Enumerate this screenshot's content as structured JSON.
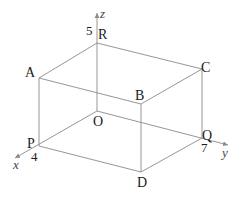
{
  "figure": {
    "type": "3d-cuboid-coordinate-diagram",
    "axes": {
      "x": {
        "label": "x",
        "tick_label": "4"
      },
      "y": {
        "label": "y",
        "tick_label": "7"
      },
      "z": {
        "label": "z",
        "tick_label": "5"
      }
    },
    "vertices": {
      "O": {
        "label": "O",
        "coords": [
          0,
          0,
          0
        ]
      },
      "P": {
        "label": "P",
        "coords": [
          4,
          0,
          0
        ]
      },
      "Q": {
        "label": "Q",
        "coords": [
          0,
          7,
          0
        ]
      },
      "R": {
        "label": "R",
        "coords": [
          0,
          0,
          5
        ]
      },
      "A": {
        "label": "A",
        "coords": [
          4,
          0,
          5
        ]
      },
      "B": {
        "label": "B",
        "coords": [
          4,
          7,
          5
        ]
      },
      "C": {
        "label": "C",
        "coords": [
          0,
          7,
          5
        ]
      },
      "D": {
        "label": "D",
        "coords": [
          4,
          7,
          0
        ]
      }
    },
    "edges": [
      [
        "O",
        "P"
      ],
      [
        "O",
        "Q"
      ],
      [
        "O",
        "R"
      ],
      [
        "R",
        "A"
      ],
      [
        "R",
        "C"
      ],
      [
        "A",
        "B"
      ],
      [
        "C",
        "B"
      ],
      [
        "A",
        "P"
      ],
      [
        "B",
        "D"
      ],
      [
        "C",
        "Q"
      ],
      [
        "P",
        "D"
      ],
      [
        "Q",
        "D"
      ]
    ],
    "colors": {
      "line": "#8a8a8a",
      "text": "#1a1a1a",
      "axis_label": "#444444"
    }
  }
}
